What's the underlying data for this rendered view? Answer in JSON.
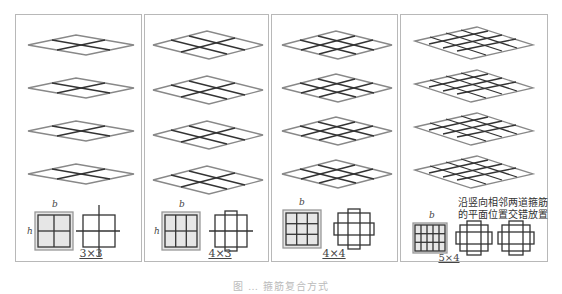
{
  "figure": {
    "caption": "图 … 箍筋复合方式",
    "dimension_labels": {
      "width": "b",
      "height": "h"
    },
    "panels": [
      {
        "id": "3x3",
        "label": "3×3",
        "cols": 2,
        "rows": 2,
        "layers": 4
      },
      {
        "id": "4x3",
        "label": "4×3",
        "cols": 3,
        "rows": 2,
        "layers": 4
      },
      {
        "id": "4x4",
        "label": "4×4",
        "cols": 3,
        "rows": 3,
        "layers": 4
      },
      {
        "id": "5x4",
        "label": "5×4",
        "cols": 4,
        "rows": 3,
        "layers": 4,
        "note_line1": "沿竖向相邻两道箍筋",
        "note_line2": "的平面位置交错放置"
      }
    ],
    "colors": {
      "line_dark": "#333333",
      "line_light": "#888888",
      "border": "#b8b8b8",
      "section_fill": "#e6e6e6"
    }
  }
}
